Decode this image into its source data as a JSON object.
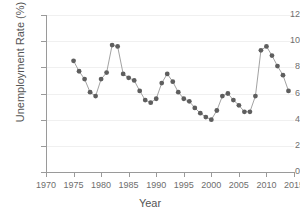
{
  "chart_data": {
    "type": "line",
    "title": "",
    "xlabel": "Year",
    "ylabel": "Unemployment Rate (%)",
    "xlim": [
      1970,
      2015
    ],
    "ylim": [
      0,
      12
    ],
    "xticks": [
      1970,
      1975,
      1980,
      1985,
      1990,
      1995,
      2000,
      2005,
      2010,
      2015
    ],
    "yticks": [
      0,
      2,
      4,
      6,
      8,
      10,
      12
    ],
    "grid": true,
    "legend": "none",
    "marker": "circle",
    "marker_color": "#5e5e5e",
    "line_color": "#8a8a8a",
    "x": [
      1975,
      1976,
      1977,
      1978,
      1979,
      1980,
      1981,
      1982,
      1983,
      1984,
      1985,
      1986,
      1987,
      1988,
      1989,
      1990,
      1991,
      1992,
      1993,
      1994,
      1995,
      1996,
      1997,
      1998,
      1999,
      2000,
      2001,
      2002,
      2003,
      2004,
      2005,
      2006,
      2007,
      2008,
      2009,
      2010,
      2011,
      2012,
      2013,
      2014
    ],
    "values": [
      8.5,
      7.7,
      7.1,
      6.1,
      5.8,
      7.1,
      7.6,
      9.7,
      9.6,
      7.5,
      7.2,
      7.0,
      6.2,
      5.5,
      5.3,
      5.6,
      6.8,
      7.5,
      6.9,
      6.1,
      5.6,
      5.4,
      4.9,
      4.5,
      4.2,
      4.0,
      4.7,
      5.8,
      6.0,
      5.5,
      5.1,
      4.6,
      4.6,
      5.8,
      9.3,
      9.6,
      8.9,
      8.1,
      7.4,
      6.2
    ]
  },
  "axis": {
    "y_labels": [
      "12",
      "10",
      "8",
      "6",
      "4",
      "2",
      "0"
    ],
    "x_labels": [
      "1970",
      "1975",
      "1980",
      "1985",
      "1990",
      "1995",
      "2000",
      "2005",
      "2010",
      "2015"
    ],
    "x_title": "Year",
    "y_title": "Unemployment Rate (%)"
  }
}
